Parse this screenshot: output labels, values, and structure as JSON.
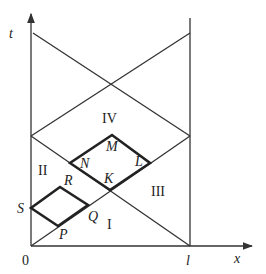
{
  "axes": {
    "x_label": "x",
    "t_label": "t",
    "origin_label": "0",
    "l_label": "l"
  },
  "regions": {
    "I": "I",
    "II": "II",
    "III": "III",
    "IV": "IV"
  },
  "points": {
    "S": "S",
    "P": "P",
    "Q": "Q",
    "R": "R",
    "N": "N",
    "K": "K",
    "L": "L",
    "M": "M"
  },
  "colors": {
    "line": "#333333",
    "bold": "#222222"
  }
}
